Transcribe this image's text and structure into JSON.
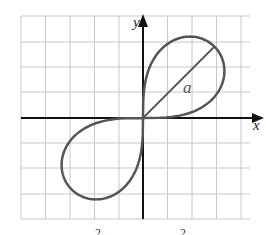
{
  "figure": {
    "type": "lemniscate",
    "equation_hint": "r^2 = a^2 sin 2θ",
    "axis_labels": {
      "x": "x",
      "y": "y"
    },
    "diameter_label": "a",
    "caption_fragment": "2  2",
    "colors": {
      "curve": "#555555",
      "grid": "#c8c8c8",
      "axis": "#111111"
    },
    "grid": {
      "cell_px": 24.5,
      "origin_px": [
        143,
        118
      ],
      "cols": 10,
      "rows": 8
    }
  }
}
